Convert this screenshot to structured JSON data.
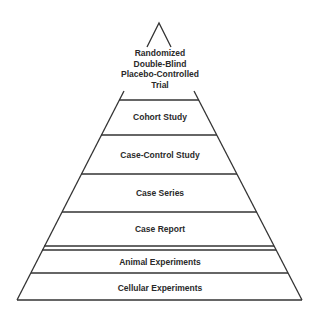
{
  "diagram": {
    "type": "evidence-pyramid",
    "line_color": "#333333",
    "levels": [
      {
        "label_lines": [
          "Randomized",
          "Double-Blind",
          "Placebo-Controlled",
          "Trial"
        ]
      },
      {
        "label": "Cohort Study"
      },
      {
        "label": "Case-Control Study"
      },
      {
        "label": "Case Series"
      },
      {
        "label": "Case Report"
      },
      {
        "label": "Animal Experiments"
      },
      {
        "label": "Cellular Experiments"
      }
    ]
  }
}
